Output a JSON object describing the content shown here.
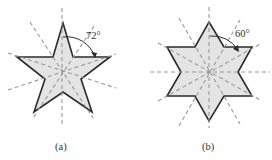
{
  "figures": [
    {
      "id": "a",
      "caption": "(a)",
      "shape": "five-pointed star",
      "symmetry_lines": 5,
      "angle_label": "72°",
      "center": [
        62,
        72
      ]
    },
    {
      "id": "b",
      "caption": "(b)",
      "shape": "six-pointed star",
      "symmetry_lines": 6,
      "angle_label": "60°",
      "center": [
        210,
        72
      ]
    }
  ],
  "colors": {
    "fill": "#e4e4e4",
    "outline": "#2b2b2b",
    "axis": "#9a9a9a"
  }
}
